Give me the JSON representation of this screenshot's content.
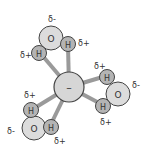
{
  "diagram": {
    "ion": {
      "label": "–",
      "color": "#d6d6d6"
    },
    "colors": {
      "oxygen": "#dcdcdc",
      "hydrogen": "#b4b4b4",
      "bond": "#9a9a9a",
      "outline": "#444444"
    },
    "waters": [
      {
        "oxygen": "O",
        "hydrogen": "H",
        "o_charge": "δ-",
        "h1_charge": "δ+",
        "h2_charge": "δ+"
      },
      {
        "oxygen": "O",
        "hydrogen": "H",
        "o_charge": "δ-",
        "h1_charge": "δ+",
        "h2_charge": "δ+"
      },
      {
        "oxygen": "O",
        "hydrogen": "H",
        "o_charge": "δ-",
        "h1_charge": "δ+",
        "h2_charge": "δ+"
      }
    ]
  }
}
